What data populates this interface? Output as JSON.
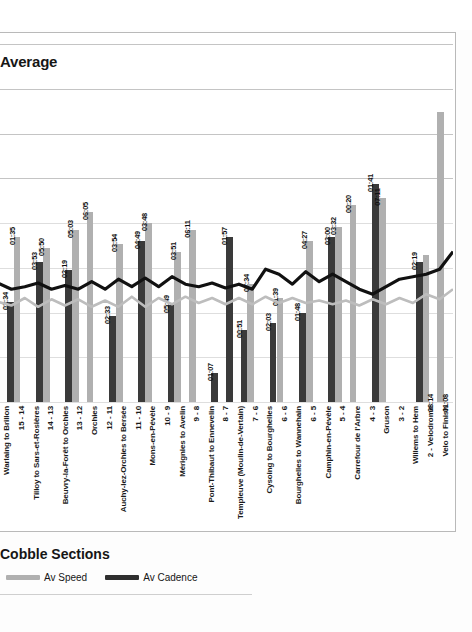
{
  "chart": {
    "title": "Average",
    "subtitle": "Cobble Sections",
    "legend": [
      {
        "name": "legend-av-speed",
        "label": "Av Speed",
        "color": "#b0b0b0"
      },
      {
        "name": "legend-av-cadence",
        "label": "Av Cadence",
        "color": "#2f2f2f"
      }
    ]
  },
  "chart_data": {
    "type": "bar",
    "title": "Average",
    "subtitle": "Cobble Sections",
    "xlabel": "",
    "ylabel": "",
    "grid": true,
    "legend_position": "bottom-left",
    "ylim": [
      0,
      100
    ],
    "categories": [
      "Warlaing to Brillon",
      "15 - 14",
      "Tilloy to Sars-et-Rosières",
      "14 - 13",
      "Beuvry-la-Forêt to Orchies",
      "13 - 12",
      "Orchies",
      "12 - 11",
      "Auchy-lez-Orchies to Bersée",
      "11 - 10",
      "Mons-en-Pévèle",
      "10 - 9",
      "Mérignies to Avelin",
      "9 - 8",
      "Pont-Thibaut to Ennevelin",
      "8 - 7",
      "Templeuve (Moulin-de-Vertain)",
      "7 - 6",
      "Cysoing to Bourghelles",
      "6 - 6",
      "Bourghelles to Wannehain",
      "6 - 5",
      "Camphin-en-Pévèle",
      "5 - 4",
      "Carrefour de l'Arbre",
      "4 - 3",
      "Gruson",
      "3 - 2",
      "Willems to Hem",
      "2 - Velodrome",
      "Velo to Finish"
    ],
    "series": [
      {
        "name": "Av Speed",
        "color": "#b0b0b0",
        "labels": [
          "",
          "01:35",
          "",
          "05:50",
          "",
          "05:03",
          "06:05",
          "",
          "03:54",
          "",
          "03:48",
          "",
          "03:51",
          "06:11",
          "",
          "",
          "",
          "07:34",
          "",
          "01:39",
          "",
          "04:27",
          "",
          "03:32",
          "00:20",
          "",
          "07:11",
          "",
          "",
          "08:14",
          "01:08"
        ],
        "values": [
          0,
          46,
          0,
          43,
          0,
          48,
          53,
          0,
          44,
          0,
          50,
          0,
          42,
          48,
          0,
          0,
          0,
          33,
          0,
          29,
          0,
          45,
          0,
          49,
          55,
          0,
          57,
          0,
          0,
          41,
          81
        ]
      },
      {
        "name": "Av Cadence",
        "color": "#3a3a3a",
        "labels": [
          "03:34",
          "",
          "03:53",
          "",
          "02:19",
          "",
          "",
          "02:33",
          "",
          "04:49",
          "",
          "05:49",
          "",
          "",
          "01:07",
          "01:57",
          "00:51",
          "",
          "02:03",
          "",
          "01:48",
          "",
          "03:00",
          "",
          "",
          "01:41",
          "",
          "",
          "02:19",
          "",
          ""
        ],
        "values": [
          28,
          0,
          39,
          0,
          37,
          0,
          0,
          24,
          0,
          45,
          0,
          27,
          0,
          0,
          8,
          46,
          20,
          0,
          22,
          0,
          25,
          0,
          46,
          0,
          0,
          61,
          0,
          0,
          39,
          0,
          0
        ]
      }
    ],
    "overlay_lines": [
      {
        "name": "Av Cadence",
        "color": "#111111",
        "values": [
          23.5,
          23.0,
          23.2,
          23.5,
          23.0,
          23.3,
          23.0,
          23.6,
          23.0,
          23.8,
          23.2,
          23.9,
          23.2,
          24.0,
          23.4,
          23.2,
          23.5,
          23.1,
          23.4,
          23.0,
          24.6,
          24.2,
          23.4,
          24.4,
          23.6,
          24.2,
          23.6,
          23.0,
          22.6,
          23.2,
          23.8,
          24.0,
          24.2,
          24.6,
          26.0
        ]
      },
      {
        "name": "Av Speed",
        "color": "#bdbdbd",
        "values": [
          12.0,
          11.7,
          12.3,
          11.6,
          12.2,
          11.7,
          12.2,
          11.6,
          12.1,
          11.6,
          12.4,
          11.6,
          12.3,
          11.8,
          12.4,
          11.9,
          12.3,
          11.8,
          12.3,
          11.8,
          12.4,
          11.9,
          12.3,
          11.9,
          12.1,
          11.8,
          12.1,
          11.7,
          12.2,
          11.8,
          12.3,
          11.9,
          12.6,
          12.2,
          13.0
        ]
      }
    ]
  }
}
